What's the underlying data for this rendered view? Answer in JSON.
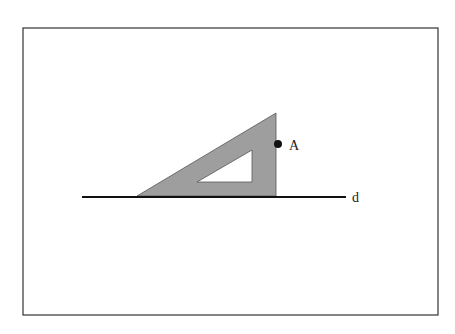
{
  "diagram": {
    "type": "geometry-construction",
    "colors": {
      "frame": "#333333",
      "set_square_fill": "#9e9e9e",
      "set_square_stroke": "#555555",
      "line": "#111111",
      "point": "#111111",
      "background": "#ffffff"
    },
    "frame": {
      "x": 23,
      "y": 28,
      "width": 415,
      "height": 287
    },
    "line_d": {
      "label": "d",
      "x1": 82,
      "y1": 197,
      "x2": 346,
      "y2": 197,
      "label_x": 352,
      "label_y": 202
    },
    "set_square": {
      "outer": [
        [
          137,
          196
        ],
        [
          276,
          113
        ],
        [
          276,
          196
        ]
      ],
      "inner_cutout": [
        [
          197,
          182
        ],
        [
          252,
          150
        ],
        [
          252,
          182
        ]
      ]
    },
    "point_A": {
      "label": "A",
      "cx": 278,
      "cy": 144,
      "r": 4,
      "label_x": 289,
      "label_y": 150
    }
  }
}
